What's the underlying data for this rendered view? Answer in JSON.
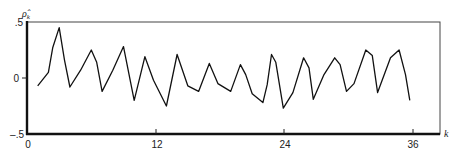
{
  "chart_data": {
    "type": "line",
    "title": "",
    "xlabel": "k",
    "ylabel": "ρ̂_k",
    "xlim": [
      0,
      38.5
    ],
    "ylim": [
      -0.5,
      0.5
    ],
    "x_ticks": [
      0,
      12,
      24,
      36
    ],
    "x_tick_labels": [
      "0",
      "12",
      "24",
      "36"
    ],
    "y_ticks": [
      0.5,
      0,
      -0.5
    ],
    "y_tick_labels": [
      ".5",
      "0",
      "–.5"
    ],
    "grid": false,
    "legend": null,
    "series": [
      {
        "name": "sample autocorrelation",
        "x": [
          1,
          2,
          2.4,
          3,
          3.5,
          4,
          5,
          6,
          6.5,
          7,
          8,
          9,
          10,
          11,
          11.8,
          13,
          14,
          15,
          16,
          17,
          17.8,
          19,
          19.9,
          20.4,
          21,
          22,
          22.4,
          22.8,
          23.2,
          23.9,
          24.8,
          25.8,
          26.3,
          26.7,
          27.7,
          28.7,
          29.2,
          29.8,
          30.5,
          31.6,
          32.2,
          32.7,
          33.9,
          34.7,
          35.3,
          35.7
        ],
        "values": [
          -0.07,
          0.05,
          0.27,
          0.45,
          0.16,
          -0.08,
          0.07,
          0.25,
          0.14,
          -0.12,
          0.07,
          0.28,
          -0.2,
          0.19,
          -0.02,
          -0.25,
          0.21,
          -0.07,
          -0.12,
          0.13,
          -0.05,
          -0.12,
          0.12,
          0.03,
          -0.14,
          -0.22,
          -0.06,
          0.21,
          0.14,
          -0.27,
          -0.13,
          0.18,
          0.09,
          -0.19,
          0.03,
          0.18,
          0.12,
          -0.12,
          -0.05,
          0.25,
          0.2,
          -0.13,
          0.18,
          0.25,
          0.03,
          -0.2
        ]
      }
    ]
  },
  "labels": {
    "y_axis_symbol": "ρ̂",
    "y_axis_subscript": "k",
    "x_axis_symbol": "k",
    "y_top": ".5",
    "y_mid": "0",
    "y_bottom": "–.5",
    "x_0": "0",
    "x_12": "12",
    "x_24": "24",
    "x_36": "36"
  }
}
